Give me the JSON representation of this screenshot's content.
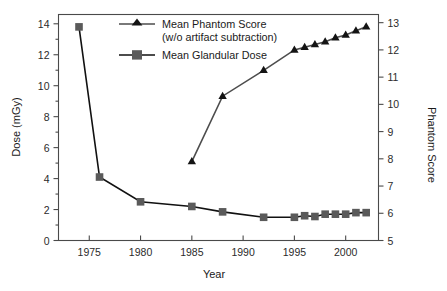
{
  "chart_data": {
    "type": "line",
    "title": "",
    "xlabel": "Year",
    "ylabel": "Dose (mGy)",
    "y2label": "Phantom Score",
    "xlim": [
      1972,
      2003.2
    ],
    "ylim": [
      0,
      14.6
    ],
    "y2lim": [
      5,
      13.3
    ],
    "grid": false,
    "legend_position": "top-center",
    "xticks": [
      1975,
      1980,
      1985,
      1990,
      1995,
      2000
    ],
    "xtick_labels": [
      "1975",
      "1980",
      "1985",
      "1990",
      "1995",
      "2000"
    ],
    "xminor_ticks": [],
    "yticks": [
      0,
      2,
      4,
      6,
      8,
      10,
      12,
      14
    ],
    "ytick_labels": [
      "0",
      "2",
      "4",
      "6",
      "8",
      "10",
      "12",
      "14"
    ],
    "yminor_ticks": [
      1,
      3,
      5,
      7,
      9,
      11,
      13
    ],
    "y2ticks": [
      5,
      6,
      7,
      8,
      9,
      10,
      11,
      12,
      13
    ],
    "y2tick_labels": [
      "5",
      "6",
      "7",
      "8",
      "9",
      "10",
      "11",
      "12",
      "13"
    ],
    "series": [
      {
        "name": "Mean  Phantom Score (w/o artifact subtraction)",
        "axis": "right",
        "marker": "triangle",
        "color": "#141414",
        "line_color": "#4d4d4d",
        "x": [
          1985,
          1988,
          1992,
          1995,
          1996,
          1997,
          1998,
          1999,
          2000,
          2001,
          2002
        ],
        "values": [
          7.9,
          10.3,
          11.25,
          12.0,
          12.1,
          12.2,
          12.3,
          12.45,
          12.55,
          12.7,
          12.85
        ]
      },
      {
        "name": "Mean  Glandular Dose",
        "axis": "left",
        "marker": "square",
        "color": "#5a5a5a",
        "line_color": "#111111",
        "x": [
          1974,
          1976,
          1980,
          1985,
          1988,
          1992,
          1995,
          1996,
          1997,
          1998,
          1999,
          2000,
          2001,
          2002
        ],
        "values": [
          13.8,
          4.1,
          2.5,
          2.2,
          1.85,
          1.5,
          1.5,
          1.6,
          1.55,
          1.7,
          1.7,
          1.7,
          1.8,
          1.8
        ]
      }
    ]
  },
  "legend": {
    "entries": [
      {
        "line1": "Mean  Phantom Score",
        "line2": "(w/o artifact subtraction)",
        "marker": "triangle-marker"
      },
      {
        "line1": "Mean  Glandular Dose",
        "line2": "",
        "marker": "square-marker"
      }
    ]
  },
  "axes": {
    "x_title": "Year",
    "y_left_title": "Dose (mGy)",
    "y_right_title": "Phantom Score"
  },
  "colors": {
    "phantom_marker": "#141414",
    "phantom_line": "#4d4d4d",
    "dose_marker": "#5a5a5a",
    "dose_line": "#111111",
    "axis": "#4a4a4a",
    "text": "#1a1a1a",
    "background": "#ffffff"
  }
}
